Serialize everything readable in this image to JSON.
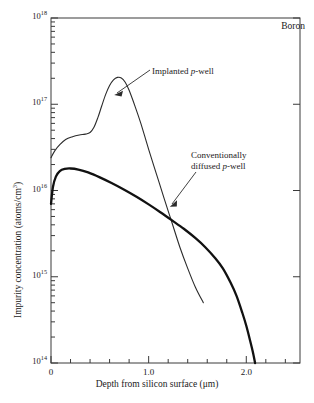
{
  "figure": {
    "species_label": "Boron",
    "x_axis_title": "Depth from silicon surface (μm)",
    "y_axis_title_main": "Impurity concentration (atoms/cm",
    "y_axis_title_sup": "3",
    "y_axis_title_tail": ")"
  },
  "annotations": {
    "implanted": {
      "prefix": "Implanted ",
      "italic": "p",
      "suffix": "-well"
    },
    "diffused": {
      "line1": "Conventionally",
      "line2_prefix": "diffused ",
      "line2_italic": "p",
      "line2_suffix": "-well"
    }
  },
  "axes": {
    "y_tick_labels": [
      {
        "mantissa": "10",
        "exponent": "18"
      },
      {
        "mantissa": "10",
        "exponent": "17"
      },
      {
        "mantissa": "10",
        "exponent": "16"
      },
      {
        "mantissa": "10",
        "exponent": "15"
      },
      {
        "mantissa": "10",
        "exponent": "14"
      }
    ],
    "x_tick_labels": [
      "0",
      "1.0",
      "2.0"
    ]
  },
  "chart_data": {
    "type": "line",
    "title": "",
    "subtitle": "",
    "xlabel": "Depth from silicon surface (μm)",
    "ylabel": "Impurity concentration (atoms/cm^3)",
    "xlim": [
      0,
      2.55
    ],
    "ylim": [
      100000000000000.0,
      1e+18
    ],
    "yscale": "log",
    "xscale": "linear",
    "grid": false,
    "legend": "none",
    "x_major_ticks": [
      0,
      1.0,
      2.0
    ],
    "x_minor_tick_step": 0.2,
    "y_major_ticks": [
      100000000000000.0,
      1000000000000000.0,
      1e+16,
      1e+17,
      1e+18
    ],
    "y_minor_ticks_per_decade": 9,
    "annotations": [
      {
        "text": "Boron",
        "position": "top-right-inside"
      },
      {
        "text": "Implanted p-well",
        "points_to_xy": [
          0.86,
          6e+16
        ]
      },
      {
        "text": "Conventionally diffused p-well",
        "points_to_xy": [
          1.45,
          3600000000000000.0
        ]
      }
    ],
    "series": [
      {
        "name": "Implanted p-well",
        "linewidth": "thin",
        "color": "#2b2b2b",
        "x": [
          0.0,
          0.04,
          0.09,
          0.15,
          0.22,
          0.29,
          0.35,
          0.4,
          0.44,
          0.48,
          0.52,
          0.56,
          0.6,
          0.64,
          0.68,
          0.72,
          0.76,
          0.8,
          0.86,
          0.92,
          1.0,
          1.08,
          1.16,
          1.24,
          1.32,
          1.4,
          1.48,
          1.56
        ],
        "y": [
          2.4e+16,
          2.9e+16,
          3.4e+16,
          3.9e+16,
          4.2e+16,
          4.4e+16,
          4.5e+16,
          4.7e+16,
          5.4e+16,
          7e+16,
          9.6e+16,
          1.3e+17,
          1.65e+17,
          1.92e+17,
          2.05e+17,
          2.02e+17,
          1.8e+17,
          1.45e+17,
          9.5e+16,
          6e+16,
          3e+16,
          1.55e+16,
          8000000000000000.0,
          4200000000000000.0,
          2200000000000000.0,
          1250000000000000.0,
          750000000000000.0,
          500000000000000.0
        ]
      },
      {
        "name": "Conventionally diffused p-well",
        "linewidth": "thick",
        "color": "#111111",
        "x": [
          0.0,
          0.02,
          0.05,
          0.09,
          0.14,
          0.2,
          0.28,
          0.38,
          0.5,
          0.62,
          0.75,
          0.88,
          1.0,
          1.12,
          1.24,
          1.36,
          1.48,
          1.58,
          1.68,
          1.76,
          1.84,
          1.9,
          1.96,
          2.0,
          2.04,
          2.07,
          2.09
        ],
        "y": [
          7000000000000000.0,
          1.1e+16,
          1.45e+16,
          1.68e+16,
          1.78e+16,
          1.8e+16,
          1.75e+16,
          1.62e+16,
          1.42e+16,
          1.22e+16,
          1.02e+16,
          8400000000000000.0,
          6900000000000000.0,
          5600000000000000.0,
          4500000000000000.0,
          3600000000000000.0,
          2800000000000000.0,
          2200000000000000.0,
          1650000000000000.0,
          1250000000000000.0,
          850000000000000.0,
          600000000000000.0,
          380000000000000.0,
          270000000000000.0,
          180000000000000.0,
          130000000000000.0,
          100000000000000.0
        ]
      }
    ]
  }
}
